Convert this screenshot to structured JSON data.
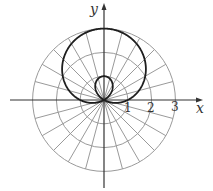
{
  "chart_data": {
    "type": "line",
    "subtype": "polar",
    "title": "",
    "equation": "r = 1 + 2 sin θ",
    "curve_name": "limaçon with inner loop",
    "xlabel": "x",
    "ylabel": "y",
    "radial_ticks": [
      1,
      2,
      3
    ],
    "rlim": [
      0,
      3
    ],
    "angular_grid_step_deg": 15,
    "grid": true,
    "legend": null,
    "series": [
      {
        "name": "r = 1 + 2 sin θ",
        "theta_deg": [
          0,
          30,
          60,
          90,
          120,
          150,
          180,
          210,
          240,
          270,
          300,
          330,
          360
        ],
        "r": [
          1,
          2,
          2.732,
          3,
          2.732,
          2,
          1,
          0,
          -0.732,
          -1,
          -0.732,
          0,
          1
        ]
      }
    ],
    "key_points": [
      {
        "label": "outer loop top",
        "x": 0,
        "y": 3
      },
      {
        "label": "inner loop top",
        "x": 0,
        "y": 1
      },
      {
        "label": "x-intercepts",
        "points": [
          [
            1,
            0
          ],
          [
            -1,
            0
          ]
        ]
      }
    ]
  },
  "labels": {
    "x_axis": "x",
    "y_axis": "y",
    "tick_1": "1",
    "tick_2": "2",
    "tick_3": "3"
  },
  "style": {
    "grid_color": "#9a9a9a",
    "curve_color": "#1e1e1e",
    "axis_color": "#333333"
  },
  "layout": {
    "origin_px": [
      104,
      100
    ],
    "px_per_unit": 23.8
  }
}
